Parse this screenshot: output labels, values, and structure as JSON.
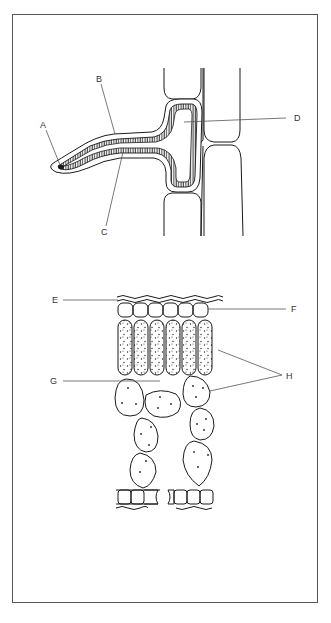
{
  "figure": {
    "top_diagram": {
      "description": "Fungal hypha penetrating between plant cells",
      "labels": [
        {
          "id": "A",
          "text": "A"
        },
        {
          "id": "B",
          "text": "B"
        },
        {
          "id": "C",
          "text": "C"
        },
        {
          "id": "D",
          "text": "D"
        }
      ]
    },
    "bottom_diagram": {
      "description": "Leaf cross-section",
      "labels": [
        {
          "id": "E",
          "text": "E"
        },
        {
          "id": "F",
          "text": "F"
        },
        {
          "id": "G",
          "text": "G"
        },
        {
          "id": "H",
          "text": "H"
        }
      ]
    },
    "colors": {
      "line": "#1a1a1a",
      "leader": "#555555",
      "frame": "#555555"
    }
  }
}
